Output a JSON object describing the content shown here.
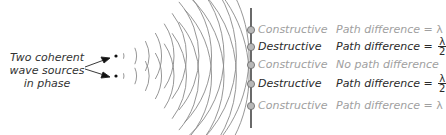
{
  "source_label": [
    "Two coherent",
    "wave sources",
    "in phase"
  ],
  "screen_points": [
    {
      "type": "Constructive",
      "style": "light",
      "path_prefix": "Path difference = ",
      "path_value": "λ",
      "fraction": false,
      "y": 30
    },
    {
      "type": "Destructive",
      "style": "dark",
      "path_prefix": "Path difference = ",
      "path_value": "λ",
      "denominator": "2",
      "fraction": true,
      "y": 47
    },
    {
      "type": "Constructive",
      "style": "light",
      "path_prefix": "No path difference",
      "path_value": "",
      "fraction": false,
      "y": 65
    },
    {
      "type": "Destructive",
      "style": "dark",
      "path_prefix": "Path difference = ",
      "path_value": "λ",
      "denominator": "2",
      "fraction": true,
      "y": 84
    },
    {
      "type": "Constructive",
      "style": "light",
      "path_prefix": "Path difference = ",
      "path_value": "λ",
      "fraction": false,
      "y": 106
    }
  ],
  "colors": {
    "light_text": "#a0a0a0",
    "dark_text": "#2a2a2a",
    "wave": "#888888",
    "screen": "#444444"
  }
}
